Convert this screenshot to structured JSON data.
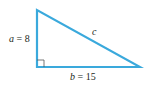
{
  "diagram": {
    "type": "right-triangle",
    "stroke_color": "#3aa9dc",
    "text_color": "#231f20",
    "vertices": {
      "top": [
        37,
        10
      ],
      "right_angle": [
        37,
        67
      ],
      "right": [
        140,
        67
      ]
    },
    "labels": {
      "a": {
        "var": "a",
        "eq": " = 8"
      },
      "b": {
        "var": "b",
        "eq": " = 15"
      },
      "c": {
        "var": "c"
      }
    },
    "right_angle_marker": true
  }
}
